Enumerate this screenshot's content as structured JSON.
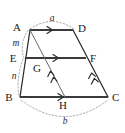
{
  "figure": {
    "background_color": "#ffffff",
    "line_color": "#2b2b2b",
    "arc_color": "#9a9a9a"
  },
  "vertices": {
    "A": {
      "label": "A",
      "x": 30,
      "y": 30,
      "label_x": 17,
      "label_y": 31
    },
    "D": {
      "label": "D",
      "x": 73,
      "y": 30,
      "label_x": 78,
      "label_y": 32
    },
    "B": {
      "label": "B",
      "x": 20,
      "y": 97,
      "label_x": 8,
      "label_y": 101
    },
    "C": {
      "label": "C",
      "x": 108,
      "y": 97,
      "label_x": 112,
      "label_y": 101
    },
    "E": {
      "label": "E",
      "x": 25,
      "y": 58,
      "label_x": 13,
      "label_y": 62
    },
    "F": {
      "label": "F",
      "x": 86,
      "y": 58,
      "label_x": 90,
      "label_y": 62
    },
    "G": {
      "label": "G",
      "x": 43,
      "y": 58,
      "label_x": 37,
      "label_y": 72
    },
    "H": {
      "label": "H",
      "x": 65,
      "y": 97,
      "label_x": 61,
      "label_y": 109
    }
  },
  "segment_labels": {
    "a": {
      "label": "a",
      "x": 52,
      "y": 21,
      "describes": "AD top side length"
    },
    "b": {
      "label": "b",
      "x": 65,
      "y": 123,
      "describes": "BC bottom side length"
    },
    "m": {
      "label": "m",
      "x": 16,
      "y": 46,
      "describes": "AE upper part of leg AB"
    },
    "n": {
      "label": "n",
      "x": 14,
      "y": 78,
      "describes": "EB lower part of leg AB"
    }
  },
  "edges": [
    {
      "name": "AD",
      "from": "A",
      "to": "D",
      "style": "thick",
      "arrows": 1
    },
    {
      "name": "EF",
      "from": "E",
      "to": "F",
      "style": "thick",
      "arrows": 1
    },
    {
      "name": "BC",
      "from": "B",
      "to": "C",
      "style": "thick",
      "arrows": 1
    },
    {
      "name": "AB",
      "from": "A",
      "to": "B",
      "style": "solid",
      "arrows": 0
    },
    {
      "name": "DC",
      "from": "D",
      "to": "C",
      "style": "solid",
      "arrows": 0
    },
    {
      "name": "AH",
      "from": "A",
      "to": "H",
      "style": "thin",
      "arrows": 2
    },
    {
      "name": "FC",
      "from": "F",
      "to": "C",
      "style": "solid",
      "arrows": 2
    }
  ],
  "arcs": [
    {
      "name": "arc-a",
      "label": "a",
      "position": "above-AD",
      "style": "dotted"
    },
    {
      "name": "arc-b",
      "label": "b",
      "position": "below-BC",
      "style": "dotted"
    },
    {
      "name": "arc-m",
      "label": "m",
      "position": "left-AE",
      "style": "dotted"
    },
    {
      "name": "arc-n",
      "label": "n",
      "position": "left-EB",
      "style": "dotted"
    }
  ]
}
